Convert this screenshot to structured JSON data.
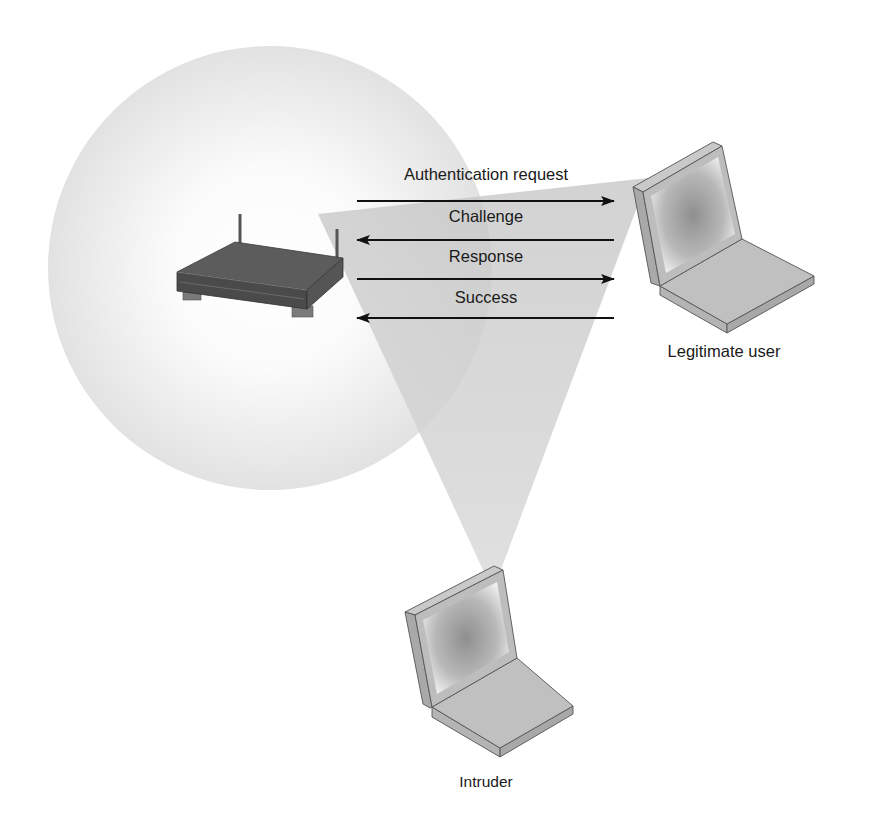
{
  "diagram": {
    "colors": {
      "background": "#ffffff",
      "coverage_circle_edge": "#e4e4e4",
      "coverage_circle_center": "#ffffff",
      "eavesdrop_cone": "#cfcfcf",
      "arrow": "#111111",
      "text": "#1a1a1a",
      "router_top": "#5a5a5a",
      "router_front": "#4a4a4a",
      "laptop_body": "#bdbdbd",
      "laptop_screen": "#9a9a9a"
    },
    "nodes": {
      "access_point": {
        "icon": "wireless-router-icon"
      },
      "legitimate_user": {
        "icon": "laptop-icon",
        "label": "Legitimate user"
      },
      "intruder": {
        "icon": "laptop-icon",
        "label": "Intruder"
      }
    },
    "messages": [
      {
        "label": "Authentication request",
        "direction": "to-user"
      },
      {
        "label": "Challenge",
        "direction": "to-access-point"
      },
      {
        "label": "Response",
        "direction": "to-user"
      },
      {
        "label": "Success",
        "direction": "to-access-point"
      }
    ]
  }
}
